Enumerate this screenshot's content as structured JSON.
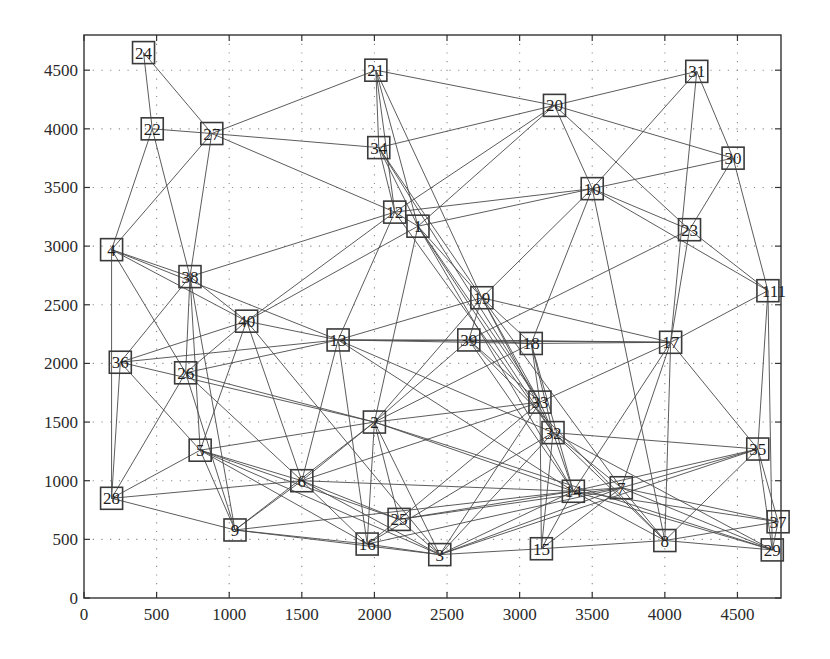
{
  "chart_data": {
    "type": "network",
    "title": "",
    "xlabel": "",
    "ylabel": "",
    "xlim": [
      0,
      4800
    ],
    "ylim": [
      0,
      4800
    ],
    "grid": true,
    "x_ticks": [
      0,
      500,
      1000,
      1500,
      2000,
      2500,
      3000,
      3500,
      4000,
      4500
    ],
    "y_ticks": [
      0,
      500,
      1000,
      1500,
      2000,
      2500,
      3000,
      3500,
      4000,
      4500
    ],
    "nodes": [
      {
        "id": "1",
        "x": 2300,
        "y": 3170
      },
      {
        "id": "2",
        "x": 2000,
        "y": 1500
      },
      {
        "id": "3",
        "x": 2450,
        "y": 370
      },
      {
        "id": "4",
        "x": 190,
        "y": 2970
      },
      {
        "id": "5",
        "x": 800,
        "y": 1260
      },
      {
        "id": "6",
        "x": 1500,
        "y": 1000
      },
      {
        "id": "7",
        "x": 3700,
        "y": 940
      },
      {
        "id": "8",
        "x": 4000,
        "y": 490
      },
      {
        "id": "9",
        "x": 1040,
        "y": 580
      },
      {
        "id": "10",
        "x": 3500,
        "y": 3490
      },
      {
        "id": "111",
        "x": 4710,
        "y": 2620
      },
      {
        "id": "12",
        "x": 2140,
        "y": 3290
      },
      {
        "id": "13",
        "x": 1750,
        "y": 2200
      },
      {
        "id": "14",
        "x": 3370,
        "y": 910
      },
      {
        "id": "15",
        "x": 3150,
        "y": 420
      },
      {
        "id": "16",
        "x": 1950,
        "y": 460
      },
      {
        "id": "17",
        "x": 4040,
        "y": 2180
      },
      {
        "id": "18",
        "x": 3080,
        "y": 2170
      },
      {
        "id": "19",
        "x": 2740,
        "y": 2560
      },
      {
        "id": "20",
        "x": 3240,
        "y": 4200
      },
      {
        "id": "21",
        "x": 2010,
        "y": 4500
      },
      {
        "id": "22",
        "x": 470,
        "y": 4000
      },
      {
        "id": "23",
        "x": 4170,
        "y": 3140
      },
      {
        "id": "24",
        "x": 410,
        "y": 4650
      },
      {
        "id": "25",
        "x": 2170,
        "y": 670
      },
      {
        "id": "26",
        "x": 700,
        "y": 1920
      },
      {
        "id": "27",
        "x": 880,
        "y": 3960
      },
      {
        "id": "29",
        "x": 4740,
        "y": 410
      },
      {
        "id": "28",
        "x": 190,
        "y": 850
      },
      {
        "id": "30",
        "x": 4470,
        "y": 3750
      },
      {
        "id": "31",
        "x": 4220,
        "y": 4490
      },
      {
        "id": "32",
        "x": 3230,
        "y": 1410
      },
      {
        "id": "33",
        "x": 3140,
        "y": 1670
      },
      {
        "id": "34",
        "x": 2030,
        "y": 3840
      },
      {
        "id": "35",
        "x": 4640,
        "y": 1270
      },
      {
        "id": "36",
        "x": 250,
        "y": 2010
      },
      {
        "id": "37",
        "x": 4780,
        "y": 650
      },
      {
        "id": "38",
        "x": 730,
        "y": 2740
      },
      {
        "id": "39",
        "x": 2650,
        "y": 2200
      },
      {
        "id": "40",
        "x": 1120,
        "y": 2360
      }
    ],
    "edges": [
      [
        "24",
        "22"
      ],
      [
        "24",
        "27"
      ],
      [
        "22",
        "27"
      ],
      [
        "22",
        "4"
      ],
      [
        "22",
        "38"
      ],
      [
        "27",
        "4"
      ],
      [
        "27",
        "38"
      ],
      [
        "27",
        "21"
      ],
      [
        "27",
        "34"
      ],
      [
        "27",
        "12"
      ],
      [
        "21",
        "34"
      ],
      [
        "21",
        "12"
      ],
      [
        "21",
        "1"
      ],
      [
        "21",
        "20"
      ],
      [
        "21",
        "19"
      ],
      [
        "34",
        "20"
      ],
      [
        "34",
        "12"
      ],
      [
        "34",
        "1"
      ],
      [
        "34",
        "19"
      ],
      [
        "34",
        "33"
      ],
      [
        "20",
        "31"
      ],
      [
        "20",
        "30"
      ],
      [
        "20",
        "10"
      ],
      [
        "20",
        "12"
      ],
      [
        "20",
        "1"
      ],
      [
        "20",
        "23"
      ],
      [
        "31",
        "10"
      ],
      [
        "31",
        "30"
      ],
      [
        "31",
        "17"
      ],
      [
        "30",
        "10"
      ],
      [
        "30",
        "23"
      ],
      [
        "30",
        "111"
      ],
      [
        "10",
        "12"
      ],
      [
        "10",
        "1"
      ],
      [
        "10",
        "23"
      ],
      [
        "10",
        "111"
      ],
      [
        "10",
        "19"
      ],
      [
        "10",
        "18"
      ],
      [
        "10",
        "8"
      ],
      [
        "23",
        "17"
      ],
      [
        "23",
        "111"
      ],
      [
        "23",
        "39"
      ],
      [
        "111",
        "17"
      ],
      [
        "111",
        "35"
      ],
      [
        "12",
        "1"
      ],
      [
        "12",
        "38"
      ],
      [
        "12",
        "40"
      ],
      [
        "12",
        "13"
      ],
      [
        "12",
        "32"
      ],
      [
        "1",
        "40"
      ],
      [
        "1",
        "2"
      ],
      [
        "1",
        "19"
      ],
      [
        "1",
        "33"
      ],
      [
        "1",
        "32"
      ],
      [
        "1",
        "14"
      ],
      [
        "4",
        "38"
      ],
      [
        "4",
        "40"
      ],
      [
        "4",
        "13"
      ],
      [
        "4",
        "26"
      ],
      [
        "4",
        "28"
      ],
      [
        "38",
        "40"
      ],
      [
        "38",
        "36"
      ],
      [
        "38",
        "26"
      ],
      [
        "38",
        "5"
      ],
      [
        "38",
        "9"
      ],
      [
        "40",
        "36"
      ],
      [
        "40",
        "26"
      ],
      [
        "40",
        "5"
      ],
      [
        "40",
        "6"
      ],
      [
        "40",
        "3"
      ],
      [
        "40",
        "13"
      ],
      [
        "36",
        "13"
      ],
      [
        "36",
        "2"
      ],
      [
        "36",
        "5"
      ],
      [
        "36",
        "28"
      ],
      [
        "26",
        "28"
      ],
      [
        "26",
        "13"
      ],
      [
        "26",
        "2"
      ],
      [
        "26",
        "6"
      ],
      [
        "26",
        "9"
      ],
      [
        "13",
        "39"
      ],
      [
        "13",
        "18"
      ],
      [
        "13",
        "17"
      ],
      [
        "13",
        "6"
      ],
      [
        "13",
        "16"
      ],
      [
        "13",
        "14"
      ],
      [
        "13",
        "32"
      ],
      [
        "39",
        "18"
      ],
      [
        "39",
        "17"
      ],
      [
        "39",
        "2"
      ],
      [
        "39",
        "33"
      ],
      [
        "39",
        "14"
      ],
      [
        "39",
        "8"
      ],
      [
        "19",
        "13"
      ],
      [
        "19",
        "39"
      ],
      [
        "19",
        "18"
      ],
      [
        "19",
        "33"
      ],
      [
        "19",
        "32"
      ],
      [
        "19",
        "17"
      ],
      [
        "19",
        "2"
      ],
      [
        "19",
        "7"
      ],
      [
        "18",
        "17"
      ],
      [
        "18",
        "33"
      ],
      [
        "18",
        "32"
      ],
      [
        "18",
        "14"
      ],
      [
        "18",
        "2"
      ],
      [
        "17",
        "33"
      ],
      [
        "17",
        "14"
      ],
      [
        "17",
        "7"
      ],
      [
        "17",
        "8"
      ],
      [
        "17",
        "35"
      ],
      [
        "33",
        "32"
      ],
      [
        "33",
        "2"
      ],
      [
        "33",
        "6"
      ],
      [
        "33",
        "25"
      ],
      [
        "33",
        "3"
      ],
      [
        "33",
        "15"
      ],
      [
        "32",
        "14"
      ],
      [
        "32",
        "7"
      ],
      [
        "32",
        "8"
      ],
      [
        "32",
        "29"
      ],
      [
        "32",
        "35"
      ],
      [
        "32",
        "3"
      ],
      [
        "32",
        "16"
      ],
      [
        "32",
        "15"
      ],
      [
        "2",
        "5"
      ],
      [
        "2",
        "6"
      ],
      [
        "2",
        "9"
      ],
      [
        "2",
        "16"
      ],
      [
        "2",
        "25"
      ],
      [
        "2",
        "3"
      ],
      [
        "2",
        "14"
      ],
      [
        "2",
        "29"
      ],
      [
        "5",
        "28"
      ],
      [
        "5",
        "6"
      ],
      [
        "5",
        "9"
      ],
      [
        "5",
        "16"
      ],
      [
        "5",
        "3"
      ],
      [
        "5",
        "25"
      ],
      [
        "6",
        "28"
      ],
      [
        "6",
        "9"
      ],
      [
        "6",
        "16"
      ],
      [
        "6",
        "25"
      ],
      [
        "6",
        "3"
      ],
      [
        "6",
        "14"
      ],
      [
        "28",
        "9"
      ],
      [
        "9",
        "16"
      ],
      [
        "9",
        "3"
      ],
      [
        "9",
        "14"
      ],
      [
        "16",
        "25"
      ],
      [
        "16",
        "3"
      ],
      [
        "16",
        "7"
      ],
      [
        "25",
        "14"
      ],
      [
        "25",
        "3"
      ],
      [
        "25",
        "7"
      ],
      [
        "3",
        "14"
      ],
      [
        "3",
        "7"
      ],
      [
        "3",
        "15"
      ],
      [
        "3",
        "35"
      ],
      [
        "15",
        "14"
      ],
      [
        "15",
        "7"
      ],
      [
        "15",
        "8"
      ],
      [
        "14",
        "7"
      ],
      [
        "14",
        "8"
      ],
      [
        "14",
        "29"
      ],
      [
        "14",
        "37"
      ],
      [
        "14",
        "35"
      ],
      [
        "7",
        "8"
      ],
      [
        "7",
        "35"
      ],
      [
        "7",
        "37"
      ],
      [
        "7",
        "29"
      ],
      [
        "8",
        "37"
      ],
      [
        "8",
        "29"
      ],
      [
        "8",
        "35"
      ],
      [
        "35",
        "37"
      ],
      [
        "35",
        "29"
      ],
      [
        "111",
        "29"
      ],
      [
        "37",
        "29"
      ]
    ]
  }
}
